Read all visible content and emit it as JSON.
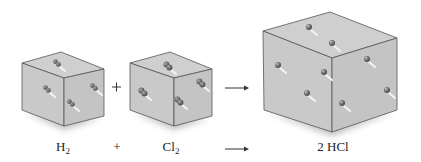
{
  "figure": {
    "colors": {
      "background": "#ffffff",
      "cube_top": "#cfcfcf",
      "cube_left": "#c9c9c9",
      "cube_right": "#c4c4c4",
      "cube_edge": "#555555",
      "molecule": "#6e6e6e",
      "motion_trail": "#f2f2f2",
      "text": "#222222"
    }
  },
  "containers": [
    {
      "id": "h2-container",
      "label": "H2",
      "molecule_type": "diatomic",
      "molecule_count": 4,
      "top": [
        [
          22,
          63
        ],
        [
          61,
          52
        ],
        [
          104,
          69
        ],
        [
          64,
          78
        ]
      ],
      "left": [
        [
          22,
          63
        ],
        [
          64,
          78
        ],
        [
          64,
          126
        ],
        [
          22,
          110
        ]
      ],
      "right": [
        [
          64,
          78
        ],
        [
          104,
          69
        ],
        [
          104,
          116
        ],
        [
          64,
          126
        ]
      ],
      "molecules": [
        [
          57,
          63
        ],
        [
          47,
          89
        ],
        [
          94,
          87
        ],
        [
          71,
          103
        ]
      ]
    },
    {
      "id": "cl2-container",
      "label": "Cl2",
      "molecule_type": "diatomic",
      "molecule_count": 4,
      "top": [
        [
          130,
          63
        ],
        [
          170,
          52
        ],
        [
          212,
          69
        ],
        [
          174,
          78
        ]
      ],
      "left": [
        [
          130,
          63
        ],
        [
          174,
          78
        ],
        [
          174,
          126
        ],
        [
          130,
          110
        ]
      ],
      "right": [
        [
          174,
          78
        ],
        [
          212,
          69
        ],
        [
          212,
          116
        ],
        [
          174,
          126
        ]
      ],
      "molecules": [
        [
          168,
          66
        ],
        [
          143,
          92
        ],
        [
          201,
          83
        ],
        [
          179,
          101
        ]
      ]
    },
    {
      "id": "hcl-container",
      "label": "2 HCl",
      "molecule_type": "product",
      "molecule_count": 8,
      "top": [
        [
          263,
          31
        ],
        [
          330,
          12
        ],
        [
          397,
          38
        ],
        [
          332,
          58
        ]
      ],
      "left": [
        [
          263,
          31
        ],
        [
          332,
          58
        ],
        [
          332,
          132
        ],
        [
          264,
          110
        ]
      ],
      "right": [
        [
          332,
          58
        ],
        [
          397,
          38
        ],
        [
          397,
          110
        ],
        [
          332,
          132
        ]
      ],
      "molecules": [
        [
          309,
          27
        ],
        [
          332,
          43
        ],
        [
          278,
          65
        ],
        [
          324,
          72
        ],
        [
          307,
          93
        ],
        [
          367,
          59
        ],
        [
          387,
          90
        ],
        [
          342,
          103
        ]
      ]
    }
  ],
  "operators": {
    "plus_top": "+",
    "arrow_top": "⟶"
  },
  "equation": {
    "reactant_1": "H",
    "reactant_1_sub": "2",
    "plus": "+",
    "reactant_2": "Cl",
    "reactant_2_sub": "2",
    "arrow": "⟶",
    "product": "2 HCl"
  }
}
